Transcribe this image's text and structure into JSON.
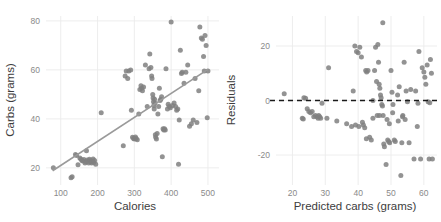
{
  "figure": {
    "background": "#ffffff",
    "point_color": "#808080",
    "grid_color": "#ebebeb",
    "fit_line_color": "#9a9a9a",
    "zero_line_color": "#1a1a1a"
  },
  "chart_data": [
    {
      "type": "scatter",
      "panel": "left",
      "title": "",
      "xlabel": "Calories",
      "ylabel": "Carbs (grams)",
      "xlim": [
        60,
        530
      ],
      "ylim": [
        13,
        82
      ],
      "xticks": [
        100,
        200,
        300,
        400,
        500
      ],
      "xticklabels": [
        "100",
        "200",
        "300",
        "400",
        "500"
      ],
      "yticks": [
        20,
        40,
        60,
        80
      ],
      "yticklabels": [
        "20",
        "40",
        "60",
        "80"
      ],
      "grid": true,
      "legend": "none",
      "annotations": [],
      "fit_line": {
        "type": "line",
        "label": "least-squares fit",
        "x": [
          78,
          500
        ],
        "y": [
          18.8,
          60.2
        ]
      },
      "x": [
        80,
        128,
        131,
        140,
        143,
        147,
        152,
        155,
        158,
        160,
        163,
        166,
        168,
        170,
        172,
        174,
        176,
        178,
        180,
        182,
        184,
        186,
        188,
        190,
        192,
        195,
        210,
        270,
        275,
        278,
        282,
        285,
        290,
        292,
        295,
        298,
        300,
        303,
        305,
        308,
        312,
        315,
        318,
        320,
        322,
        325,
        330,
        335,
        340,
        342,
        345,
        347,
        348,
        350,
        351,
        352,
        353,
        354,
        355,
        356,
        357,
        358,
        360,
        362,
        364,
        366,
        368,
        370,
        372,
        374,
        376,
        378,
        380,
        382,
        384,
        386,
        390,
        392,
        395,
        398,
        400,
        404,
        408,
        412,
        415,
        418,
        420,
        422,
        425,
        428,
        430,
        435,
        440,
        445,
        450,
        455,
        460,
        465,
        470,
        475,
        478,
        482,
        485,
        488,
        490,
        492,
        495,
        498,
        500
      ],
      "y": [
        20.0,
        16.0,
        16.4,
        25.5,
        25.0,
        21.3,
        24.0,
        23.5,
        23.0,
        22.8,
        23.4,
        22.0,
        22.5,
        27.0,
        23.2,
        22.6,
        22.0,
        23.5,
        23.0,
        22.4,
        22.0,
        22.8,
        23.6,
        22.2,
        23.0,
        21.5,
        42.5,
        29.0,
        57.5,
        59.5,
        56.5,
        59.5,
        60.0,
        43.5,
        32.5,
        32.0,
        31.8,
        32.6,
        32.0,
        31.5,
        42.0,
        52.0,
        53.5,
        52.5,
        51.5,
        53.0,
        62.0,
        45.0,
        60.5,
        66.5,
        61.0,
        57.5,
        56.5,
        50.0,
        48.5,
        47.0,
        45.5,
        44.0,
        48.0,
        46.5,
        33.5,
        32.5,
        31.8,
        34.0,
        42.0,
        45.0,
        52.5,
        47.5,
        48.0,
        49.0,
        24.5,
        36.0,
        35.5,
        36.0,
        35.5,
        60.5,
        44.0,
        46.0,
        45.0,
        44.5,
        79.5,
        45.5,
        46.5,
        45.0,
        43.5,
        44.0,
        21.5,
        39.5,
        68.0,
        58.5,
        59.0,
        54.5,
        59.0,
        62.0,
        37.0,
        38.0,
        39.5,
        56.5,
        38.5,
        51.5,
        77.5,
        73.0,
        72.5,
        65.5,
        59.5,
        74.0,
        70.0,
        40.5,
        59.5
      ]
    },
    {
      "type": "scatter",
      "panel": "right",
      "title": "",
      "xlabel": "Predicted carbs (grams)",
      "ylabel": "Residuals",
      "xlim": [
        15,
        64
      ],
      "ylim": [
        -31,
        31
      ],
      "xticks": [
        20,
        30,
        40,
        50,
        60
      ],
      "xticklabels": [
        "20",
        "30",
        "40",
        "50",
        "60"
      ],
      "yticks": [
        -20,
        0,
        20
      ],
      "yticklabels": [
        "-20",
        "0",
        "20"
      ],
      "grid": true,
      "legend": "none",
      "annotations": [],
      "zero_line": {
        "type": "hline",
        "label": "zero residual reference",
        "y": 0,
        "style": "dashed"
      },
      "x": [
        17.5,
        23.0,
        23.3,
        23.5,
        24.0,
        24.5,
        25.0,
        25.5,
        26.0,
        26.5,
        27.0,
        27.5,
        27.8,
        28.0,
        28.3,
        28.6,
        29.0,
        31.0,
        38.0,
        38.5,
        39.0,
        39.5,
        40.0,
        40.5,
        41.0,
        41.3,
        41.6,
        42.0,
        42.3,
        42.6,
        43.0,
        44.5,
        45.0,
        45.3,
        45.6,
        46.0,
        46.2,
        46.4,
        46.6,
        46.8,
        47.0,
        47.2,
        47.4,
        47.6,
        47.8,
        48.0,
        48.5,
        49.0,
        49.3,
        49.6,
        50.0,
        50.3,
        50.6,
        51.0,
        51.3,
        52.0,
        52.5,
        53.0,
        53.3,
        53.6,
        54.0,
        54.3,
        54.6,
        55.0,
        56.0,
        57.0,
        57.5,
        58.0,
        58.5,
        59.0,
        59.5,
        60.0,
        60.3,
        60.6,
        61.0,
        61.3,
        61.6,
        62.0,
        62.3,
        62.6,
        47.5,
        46.5,
        50.5,
        44.0,
        43.5,
        42.5,
        53.5,
        49.5,
        44.5,
        40.2,
        39.2,
        52.2,
        55.5,
        58.2,
        61.8,
        36.5,
        33.5,
        30.5,
        48.8,
        45.8
      ],
      "y": [
        2.5,
        -6.5,
        -6.8,
        1.0,
        0.8,
        -3.0,
        -4.0,
        -4.5,
        -4.0,
        -6.0,
        -5.5,
        -6.0,
        -6.5,
        -5.5,
        -6.0,
        -6.5,
        -1.0,
        12.0,
        -9.5,
        3.5,
        20.0,
        18.0,
        17.5,
        19.5,
        16.0,
        -8.0,
        -9.0,
        -10.0,
        11.0,
        10.5,
        11.0,
        0.0,
        11.0,
        19.5,
        7.0,
        20.5,
        14.0,
        6.0,
        4.5,
        2.0,
        1.0,
        -1.5,
        -2.0,
        -5.5,
        -16.0,
        -17.0,
        -23.5,
        -14.5,
        -15.0,
        -15.5,
        11.0,
        3.0,
        -1.5,
        -14.5,
        -15.0,
        2.0,
        5.0,
        -27.5,
        -15.5,
        -5.5,
        14.0,
        -7.0,
        3.5,
        -0.5,
        4.0,
        -21.5,
        3.5,
        -9.5,
        18.0,
        -21.5,
        12.0,
        10.5,
        8.5,
        6.0,
        13.0,
        -0.5,
        -21.5,
        15.0,
        10.0,
        -21.5,
        28.5,
        -5.5,
        -4.5,
        -14.5,
        -13.5,
        -14.0,
        -6.0,
        -8.5,
        -6.5,
        -9.5,
        -9.0,
        -7.5,
        -15.5,
        -1.0,
        -0.8,
        -8.5,
        -7.5,
        -6.5,
        -7.0,
        -5.5
      ]
    }
  ]
}
